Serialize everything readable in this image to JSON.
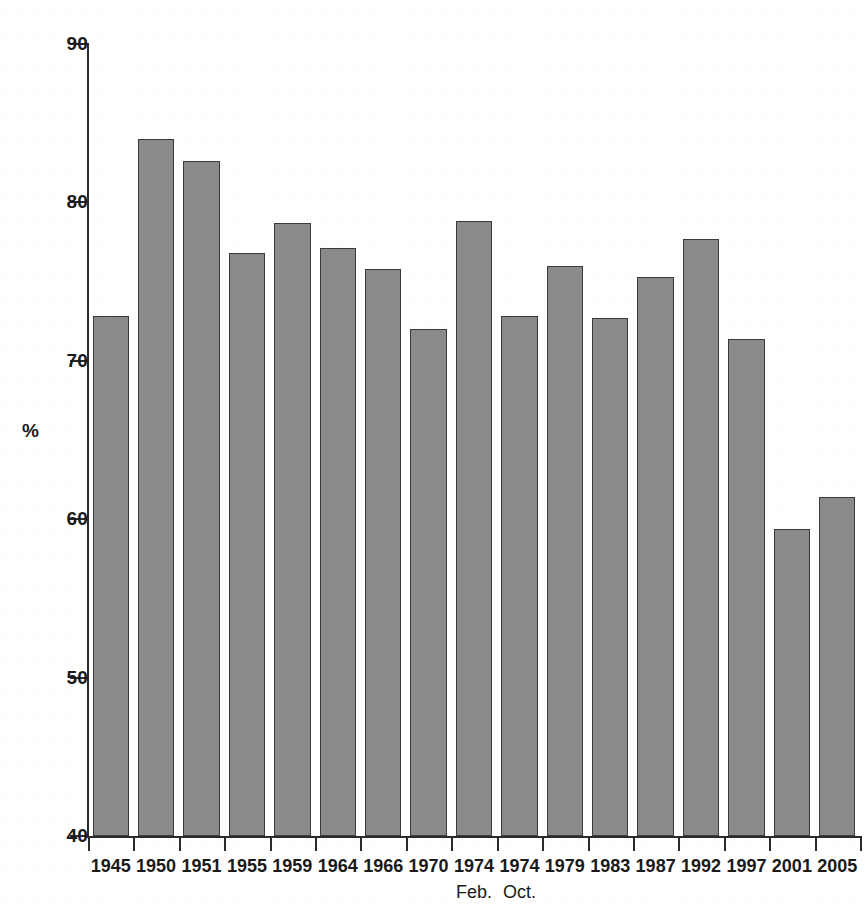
{
  "chart_data": {
    "type": "bar",
    "title": "",
    "subtitle": "",
    "xlabel": "",
    "ylabel": "%",
    "ylim": [
      40,
      90
    ],
    "yticks": [
      40,
      50,
      60,
      70,
      80,
      90
    ],
    "ytick_labels": [
      "40",
      "50",
      "60",
      "70",
      "80",
      "90"
    ],
    "grid": false,
    "legend": null,
    "bar_color": "#8a8a8a",
    "bar_edge_color": "#3a3a3a",
    "axis_color": "#2b2b2b",
    "background_color": "#ffffff",
    "categories": [
      "1945",
      "1950",
      "1951",
      "1955",
      "1959",
      "1964",
      "1966",
      "1970",
      "1974",
      "1974",
      "1979",
      "1983",
      "1987",
      "1992",
      "1997",
      "2001",
      "2005"
    ],
    "sublabels": [
      "",
      "",
      "",
      "",
      "",
      "",
      "",
      "",
      "Feb.",
      "Oct.",
      "",
      "",
      "",
      "",
      "",
      "",
      ""
    ],
    "values": [
      72.8,
      84.0,
      82.6,
      76.8,
      78.7,
      77.1,
      75.8,
      72.0,
      78.8,
      72.8,
      76.0,
      72.7,
      75.3,
      77.7,
      71.4,
      59.4,
      61.4
    ]
  }
}
